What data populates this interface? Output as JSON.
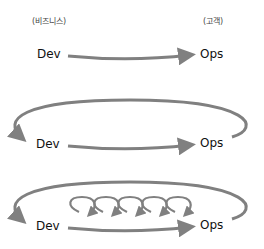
{
  "header": {
    "left_label": "(비즈니스)",
    "right_label": "(고객)"
  },
  "diagrams": [
    {
      "name": "first-way",
      "from": "Dev",
      "to": "Ops",
      "feedback_loop": false,
      "inner_loops": 0
    },
    {
      "name": "second-way",
      "from": "Dev",
      "to": "Ops",
      "feedback_loop": true,
      "inner_loops": 0
    },
    {
      "name": "third-way",
      "from": "Dev",
      "to": "Ops",
      "feedback_loop": true,
      "inner_loops": 5
    }
  ],
  "colors": {
    "arrow": "#808080",
    "text": "#111111"
  }
}
